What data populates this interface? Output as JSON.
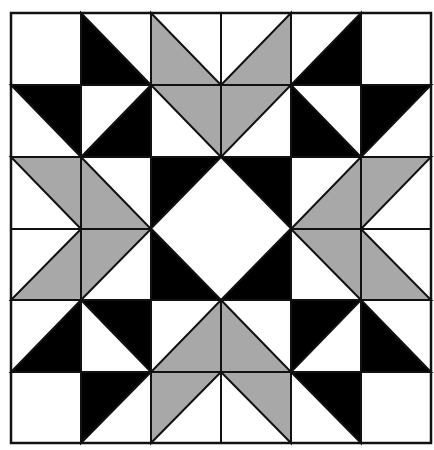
{
  "figure": {
    "rows": 6,
    "cols": 6,
    "grid_x": [
      11,
      81,
      151,
      221,
      291,
      361,
      431
    ],
    "grid_y": [
      13,
      85,
      157,
      229,
      300,
      372,
      443
    ],
    "colors": {
      "background": "#ffffff",
      "black": "#000000",
      "gray": "#a8a8a8",
      "white": "#ffffff",
      "line": "#111111"
    },
    "cells": [
      [
        {
          "fill": "white",
          "tri": "none"
        },
        {
          "fill": "black",
          "tri": "BL"
        },
        {
          "fill": "gray",
          "tri": "BL"
        },
        {
          "fill": "gray",
          "tri": "BR"
        },
        {
          "fill": "black",
          "tri": "BR"
        },
        {
          "fill": "white",
          "tri": "none"
        }
      ],
      [
        {
          "fill": "black",
          "tri": "TR"
        },
        {
          "fill": "black",
          "tri": "BR"
        },
        {
          "fill": "gray",
          "tri": "TR"
        },
        {
          "fill": "gray",
          "tri": "TL"
        },
        {
          "fill": "black",
          "tri": "BL"
        },
        {
          "fill": "black",
          "tri": "TL"
        }
      ],
      [
        {
          "fill": "gray",
          "tri": "TR"
        },
        {
          "fill": "gray",
          "tri": "BL"
        },
        {
          "fill": "center",
          "tri": "center"
        },
        {
          "fill": "center",
          "tri": "center"
        },
        {
          "fill": "gray",
          "tri": "BR"
        },
        {
          "fill": "gray",
          "tri": "TL"
        }
      ],
      [
        {
          "fill": "gray",
          "tri": "BR"
        },
        {
          "fill": "gray",
          "tri": "TL"
        },
        {
          "fill": "center",
          "tri": "center"
        },
        {
          "fill": "center",
          "tri": "center"
        },
        {
          "fill": "gray",
          "tri": "TR"
        },
        {
          "fill": "gray",
          "tri": "BL"
        }
      ],
      [
        {
          "fill": "black",
          "tri": "BR"
        },
        {
          "fill": "black",
          "tri": "TR"
        },
        {
          "fill": "gray",
          "tri": "BR"
        },
        {
          "fill": "gray",
          "tri": "BL"
        },
        {
          "fill": "black",
          "tri": "TL"
        },
        {
          "fill": "black",
          "tri": "BL"
        }
      ],
      [
        {
          "fill": "white",
          "tri": "none"
        },
        {
          "fill": "black",
          "tri": "TL"
        },
        {
          "fill": "gray",
          "tri": "TL"
        },
        {
          "fill": "gray",
          "tri": "TR"
        },
        {
          "fill": "black",
          "tri": "TR"
        },
        {
          "fill": "white",
          "tri": "none"
        }
      ]
    ],
    "center": {
      "span_cols": [
        2,
        3
      ],
      "span_rows": [
        2,
        3
      ],
      "corner_fill": "black",
      "diamond_fill": "white"
    }
  }
}
